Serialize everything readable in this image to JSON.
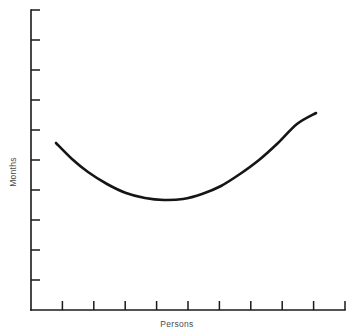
{
  "chart_data": {
    "type": "line",
    "title": "",
    "subtitle": "",
    "xlabel": "Persons",
    "ylabel": "Months",
    "grid": false,
    "legend": false,
    "annotations": [],
    "xlim": [
      0,
      10
    ],
    "ylim": [
      0,
      10
    ],
    "x_tick_labels": [
      "",
      "",
      "",
      "",
      "",
      "",
      "",
      "",
      "",
      ""
    ],
    "y_tick_labels": [
      "",
      "",
      "",
      "",
      "",
      "",
      "",
      "",
      "",
      ""
    ],
    "x_tick_count": 10,
    "y_tick_count": 10,
    "series": [
      {
        "name": "effort-curve",
        "x": [
          0.8,
          1.3,
          1.8,
          2.4,
          3.0,
          3.6,
          4.2,
          4.8,
          5.4,
          6.0,
          6.6,
          7.2,
          7.8,
          8.4,
          9.0
        ],
        "y": [
          5.57,
          5.05,
          4.63,
          4.25,
          3.98,
          3.82,
          3.75,
          3.8,
          3.96,
          4.22,
          4.59,
          5.05,
          5.6,
          6.22,
          6.57
        ],
        "color": "#151515"
      }
    ],
    "curve_points_px": [
      [
        56,
        143
      ],
      [
        72,
        159
      ],
      [
        88,
        172
      ],
      [
        107,
        184
      ],
      [
        126,
        193
      ],
      [
        145,
        198
      ],
      [
        164,
        200
      ],
      [
        183,
        199
      ],
      [
        202,
        194
      ],
      [
        221,
        186
      ],
      [
        240,
        174
      ],
      [
        259,
        160
      ],
      [
        278,
        143
      ],
      [
        297,
        124
      ],
      [
        316,
        113
      ]
    ],
    "axes_px": {
      "origin_x": 31,
      "origin_y": 310,
      "top_y": 10,
      "right_x": 345,
      "tick_len": 9
    }
  },
  "labels": {
    "x_axis": "Persons",
    "y_axis": "Months"
  },
  "colors": {
    "curve": "#151515",
    "axis": "#1a1a1a",
    "label_text": "#4a4a4a",
    "background": "#ffffff"
  }
}
